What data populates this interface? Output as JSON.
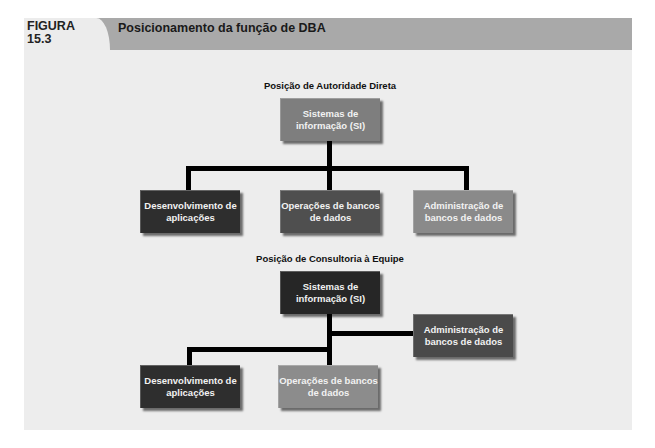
{
  "figure": {
    "label_line1": "FIGURA",
    "label_line2": "15.3",
    "title": "Posicionamento da função de DBA"
  },
  "colors": {
    "header_band": "#a9a9a9",
    "panel_background": "#ededed",
    "connector": "#000000"
  },
  "diagrams": {
    "direct": {
      "title": "Posição de Autoridade Direta",
      "root": {
        "label": "Sistemas de informação (SI)",
        "color": "#7e7e7e"
      },
      "children": [
        {
          "label": "Desenvolvimento de aplicações",
          "color": "#2e2e2e"
        },
        {
          "label": "Operações de bancos de dados",
          "color": "#4f4f4f"
        },
        {
          "label": "Administração de bancos de dados",
          "color": "#8a8a8a"
        }
      ]
    },
    "staff": {
      "title": "Posição de Consultoria à Equipe",
      "root": {
        "label": "Sistemas de informação (SI)",
        "color": "#262626"
      },
      "staff_node": {
        "label": "Administração de bancos de dados",
        "color": "#4a4a4a"
      },
      "children": [
        {
          "label": "Desenvolvimento de aplicações",
          "color": "#2e2e2e"
        },
        {
          "label": "Operações de bancos de dados",
          "color": "#8c8c8c"
        }
      ]
    }
  }
}
